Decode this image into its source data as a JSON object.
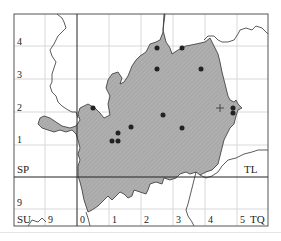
{
  "map": {
    "title": "",
    "colors": {
      "fill": "#a9a9a9",
      "hatch": "#bdbdbd",
      "outline": "#333333",
      "grid_major": "#222222",
      "grid_minor": "#d8d8d8",
      "dot": "#222222"
    },
    "grid_squares": {
      "SP": "SP",
      "TL": "TL",
      "SU": "SU",
      "TQ": "TQ"
    },
    "y_labels": [
      "4",
      "3",
      "2",
      "1",
      "9"
    ],
    "x_labels": [
      "9",
      "0",
      "1",
      "2",
      "3",
      "4",
      "5"
    ],
    "records_dots": [
      {
        "x": 157,
        "y": 48
      },
      {
        "x": 182,
        "y": 48
      },
      {
        "x": 157,
        "y": 69
      },
      {
        "x": 201,
        "y": 69
      },
      {
        "x": 93,
        "y": 108
      },
      {
        "x": 163,
        "y": 115
      },
      {
        "x": 131,
        "y": 127
      },
      {
        "x": 182,
        "y": 128
      },
      {
        "x": 118,
        "y": 133
      },
      {
        "x": 112,
        "y": 141
      },
      {
        "x": 118,
        "y": 141
      },
      {
        "x": 233,
        "y": 108
      },
      {
        "x": 233,
        "y": 113
      }
    ],
    "plus_markers": [
      {
        "x": 220,
        "y": 108
      }
    ]
  }
}
